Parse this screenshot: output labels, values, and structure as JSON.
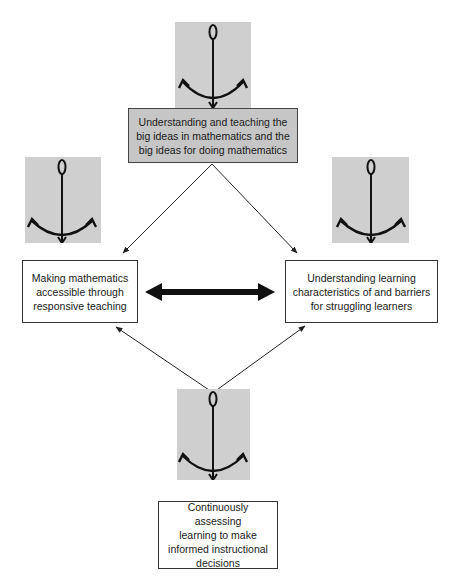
{
  "diagram": {
    "nodes": {
      "top": {
        "lines": [
          "Understanding and teaching the",
          "big ideas in mathematics and the",
          "big ideas for doing mathematics"
        ],
        "fill": "#c6c6c6"
      },
      "left": {
        "lines": [
          "Making mathematics",
          "accessible through",
          "responsive teaching"
        ]
      },
      "right": {
        "lines": [
          "Understanding learning",
          "characteristics of and barriers",
          "for struggling learners"
        ]
      },
      "bottom": {
        "lines": [
          "Continuously assessing",
          "learning to make",
          "informed instructional",
          "decisions"
        ]
      }
    },
    "anchors": [
      {
        "id": "top",
        "icon": "anchor-icon",
        "fill": "#cfcfcf"
      },
      {
        "id": "left",
        "icon": "anchor-icon",
        "fill": "#cfcfcf"
      },
      {
        "id": "right",
        "icon": "anchor-icon",
        "fill": "#cfcfcf"
      },
      {
        "id": "bottom",
        "icon": "anchor-icon",
        "fill": "#cfcfcf"
      }
    ],
    "edges": [
      {
        "from": "top",
        "to": "left",
        "type": "arrow"
      },
      {
        "from": "top",
        "to": "right",
        "type": "arrow"
      },
      {
        "from": "bottom",
        "to": "left",
        "type": "arrow"
      },
      {
        "from": "bottom",
        "to": "right",
        "type": "arrow"
      },
      {
        "from": "left",
        "to": "right",
        "type": "bidirectional-thick-arrow"
      }
    ]
  }
}
